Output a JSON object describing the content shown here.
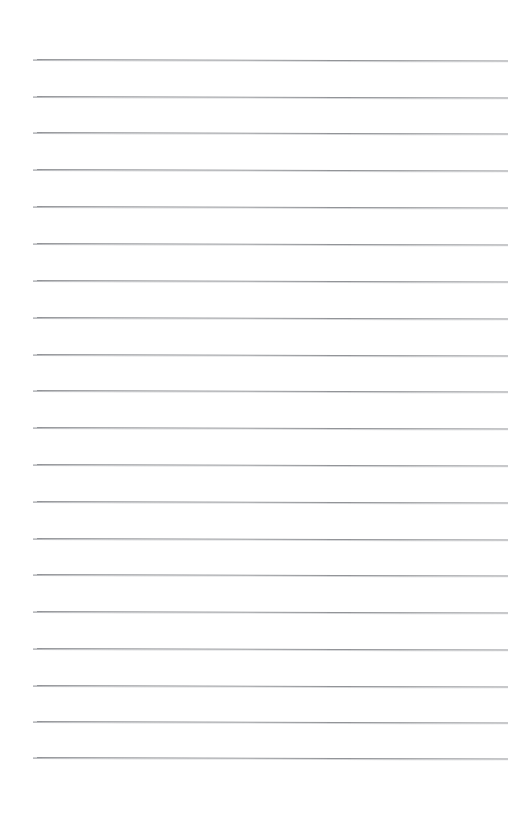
{
  "document": {
    "kind": "lined-paper-scan",
    "title": "Blank Lined Notepaper",
    "description": "A scanned sheet of blank ruled writing paper with evenly spaced horizontal rule lines and no written content.",
    "page_width": 508,
    "page_height": 821,
    "background_color": "#ffffff",
    "has_text_content": false,
    "has_margin_rule": false,
    "has_holes": false,
    "written_text": ""
  },
  "ruling": {
    "line_count": 20,
    "line_color": "#8d8f93",
    "line_thickness_px": 1,
    "left_margin_px": 33,
    "right_edge_px": 508,
    "first_line_y_px": 59,
    "line_spacing_px": 36.75,
    "tilt_degrees": 0.18,
    "lines": [
      {
        "index": 1,
        "y": 59,
        "x_start": 33,
        "x_end": 508
      },
      {
        "index": 2,
        "y": 96,
        "x_start": 33,
        "x_end": 508
      },
      {
        "index": 3,
        "y": 132,
        "x_start": 33,
        "x_end": 508
      },
      {
        "index": 4,
        "y": 169,
        "x_start": 33,
        "x_end": 508
      },
      {
        "index": 5,
        "y": 206,
        "x_start": 33,
        "x_end": 508
      },
      {
        "index": 6,
        "y": 243,
        "x_start": 33,
        "x_end": 508
      },
      {
        "index": 7,
        "y": 280,
        "x_start": 33,
        "x_end": 508
      },
      {
        "index": 8,
        "y": 317,
        "x_start": 33,
        "x_end": 508
      },
      {
        "index": 9,
        "y": 354,
        "x_start": 33,
        "x_end": 508
      },
      {
        "index": 10,
        "y": 390,
        "x_start": 33,
        "x_end": 508
      },
      {
        "index": 11,
        "y": 427,
        "x_start": 33,
        "x_end": 508
      },
      {
        "index": 12,
        "y": 464,
        "x_start": 33,
        "x_end": 508
      },
      {
        "index": 13,
        "y": 501,
        "x_start": 33,
        "x_end": 508
      },
      {
        "index": 14,
        "y": 538,
        "x_start": 33,
        "x_end": 508
      },
      {
        "index": 15,
        "y": 574,
        "x_start": 33,
        "x_end": 508
      },
      {
        "index": 16,
        "y": 611,
        "x_start": 33,
        "x_end": 508
      },
      {
        "index": 17,
        "y": 648,
        "x_start": 33,
        "x_end": 508
      },
      {
        "index": 18,
        "y": 685,
        "x_start": 33,
        "x_end": 508
      },
      {
        "index": 19,
        "y": 721,
        "x_start": 33,
        "x_end": 508
      },
      {
        "index": 20,
        "y": 757,
        "x_start": 33,
        "x_end": 508
      }
    ]
  },
  "regions": {
    "top_blank_band_height_px": 59,
    "bottom_blank_band_height_px": 64,
    "left_blank_gutter_px": 33
  }
}
